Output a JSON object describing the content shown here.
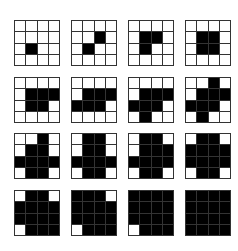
{
  "figure": {
    "grid_size": 4,
    "colors": {
      "filled": "#000000",
      "empty": "#ffffff",
      "line": "#333333"
    },
    "rows": [
      [
        [
          [
            0,
            0,
            0,
            0
          ],
          [
            0,
            0,
            0,
            0
          ],
          [
            0,
            1,
            0,
            0
          ],
          [
            0,
            0,
            0,
            0
          ]
        ],
        [
          [
            0,
            0,
            0,
            0
          ],
          [
            0,
            0,
            1,
            0
          ],
          [
            0,
            1,
            0,
            0
          ],
          [
            0,
            0,
            0,
            0
          ]
        ],
        [
          [
            0,
            0,
            0,
            0
          ],
          [
            0,
            1,
            1,
            0
          ],
          [
            0,
            1,
            0,
            0
          ],
          [
            0,
            0,
            0,
            0
          ]
        ],
        [
          [
            0,
            0,
            0,
            0
          ],
          [
            0,
            1,
            1,
            0
          ],
          [
            0,
            1,
            1,
            0
          ],
          [
            0,
            0,
            0,
            0
          ]
        ]
      ],
      [
        [
          [
            0,
            0,
            0,
            0
          ],
          [
            0,
            1,
            1,
            1
          ],
          [
            0,
            1,
            1,
            0
          ],
          [
            0,
            0,
            0,
            0
          ]
        ],
        [
          [
            0,
            0,
            0,
            0
          ],
          [
            0,
            1,
            1,
            1
          ],
          [
            1,
            1,
            1,
            0
          ],
          [
            0,
            0,
            0,
            0
          ]
        ],
        [
          [
            0,
            0,
            0,
            0
          ],
          [
            0,
            1,
            1,
            1
          ],
          [
            1,
            1,
            1,
            0
          ],
          [
            0,
            1,
            0,
            0
          ]
        ],
        [
          [
            0,
            0,
            1,
            0
          ],
          [
            0,
            1,
            1,
            1
          ],
          [
            1,
            1,
            1,
            0
          ],
          [
            0,
            1,
            0,
            0
          ]
        ]
      ],
      [
        [
          [
            0,
            0,
            1,
            0
          ],
          [
            0,
            1,
            1,
            0
          ],
          [
            1,
            1,
            1,
            1
          ],
          [
            0,
            1,
            1,
            0
          ]
        ],
        [
          [
            0,
            1,
            1,
            0
          ],
          [
            0,
            1,
            1,
            0
          ],
          [
            1,
            1,
            1,
            1
          ],
          [
            0,
            1,
            1,
            0
          ]
        ],
        [
          [
            0,
            1,
            1,
            0
          ],
          [
            0,
            1,
            1,
            1
          ],
          [
            1,
            1,
            1,
            1
          ],
          [
            0,
            1,
            1,
            0
          ]
        ],
        [
          [
            0,
            1,
            1,
            0
          ],
          [
            1,
            1,
            1,
            1
          ],
          [
            1,
            1,
            1,
            1
          ],
          [
            0,
            1,
            1,
            0
          ]
        ]
      ],
      [
        [
          [
            0,
            1,
            1,
            0
          ],
          [
            1,
            1,
            1,
            1
          ],
          [
            1,
            1,
            1,
            1
          ],
          [
            0,
            1,
            1,
            1
          ]
        ],
        [
          [
            1,
            1,
            1,
            0
          ],
          [
            1,
            1,
            1,
            1
          ],
          [
            1,
            1,
            1,
            1
          ],
          [
            0,
            1,
            1,
            1
          ]
        ],
        [
          [
            1,
            1,
            1,
            1
          ],
          [
            1,
            1,
            1,
            1
          ],
          [
            1,
            1,
            1,
            1
          ],
          [
            0,
            1,
            1,
            1
          ]
        ],
        [
          [
            1,
            1,
            1,
            1
          ],
          [
            1,
            1,
            1,
            1
          ],
          [
            1,
            1,
            1,
            1
          ],
          [
            1,
            1,
            1,
            1
          ]
        ]
      ]
    ]
  }
}
